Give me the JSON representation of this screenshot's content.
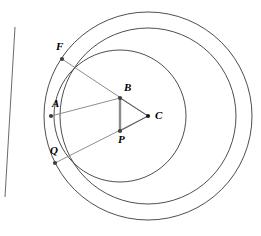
{
  "figure": {
    "type": "geometry-diagram",
    "width": 261,
    "height": 236,
    "background": "#ffffff",
    "stroke_color": "#3a3a3a",
    "thick_stroke_color": "#808080",
    "point_color": "#404040"
  },
  "points": [
    {
      "id": "F",
      "label": "F",
      "x": 62,
      "y": 59,
      "label_x": 56,
      "label_y": 41,
      "dot": true
    },
    {
      "id": "A",
      "label": "A",
      "x": 51,
      "y": 116,
      "label_x": 52,
      "label_y": 98,
      "dot": true
    },
    {
      "id": "B",
      "label": "B",
      "x": 120,
      "y": 98,
      "label_x": 124,
      "label_y": 82,
      "dot": true
    },
    {
      "id": "C",
      "label": "C",
      "x": 148,
      "y": 116,
      "label_x": 155,
      "label_y": 110,
      "dot": true
    },
    {
      "id": "P",
      "label": "P",
      "x": 120,
      "y": 131,
      "label_x": 118,
      "label_y": 134,
      "dot": true
    },
    {
      "id": "Q",
      "label": "Q",
      "x": 55,
      "y": 163,
      "label_x": 50,
      "label_y": 145,
      "dot": true
    }
  ],
  "circles": [
    {
      "id": "outer-circle",
      "cx": 148,
      "cy": 116,
      "r": 104,
      "stroke": "#3a3a3a",
      "width": 0.9
    },
    {
      "id": "middle-circle",
      "cx": 148,
      "cy": 116,
      "r": 88,
      "stroke": "#3a3a3a",
      "width": 0.9
    },
    {
      "id": "inner-circle",
      "cx": 120,
      "cy": 116,
      "r": 66,
      "stroke": "#3a3a3a",
      "width": 0.9
    }
  ],
  "lines": [
    {
      "id": "secant-FQ",
      "x1": 15,
      "y1": 27,
      "x2": 5,
      "y2": 197,
      "stroke": "#595959",
      "width": 0.9
    },
    {
      "id": "chord-FC",
      "x1": 62,
      "y1": 59,
      "x2": 148,
      "y2": 116,
      "stroke": "#808080",
      "width": 0.9
    },
    {
      "id": "chord-QC",
      "x1": 55,
      "y1": 163,
      "x2": 148,
      "y2": 116,
      "stroke": "#808080",
      "width": 0.9
    },
    {
      "id": "segment-AB",
      "x1": 51,
      "y1": 116,
      "x2": 120,
      "y2": 98,
      "stroke": "#808080",
      "width": 0.9
    },
    {
      "id": "segment-BC",
      "x1": 120,
      "y1": 98,
      "x2": 148,
      "y2": 116,
      "stroke": "#595959",
      "width": 1.0
    },
    {
      "id": "segment-PC",
      "x1": 120,
      "y1": 131,
      "x2": 148,
      "y2": 116,
      "stroke": "#595959",
      "width": 1.0
    },
    {
      "id": "segment-BP",
      "x1": 120,
      "y1": 98,
      "x2": 120,
      "y2": 131,
      "stroke": "#8c8c8c",
      "width": 2.4
    }
  ],
  "labels": {
    "F": "F",
    "A": "A",
    "B": "B",
    "C": "C",
    "P": "P",
    "Q": "Q"
  }
}
